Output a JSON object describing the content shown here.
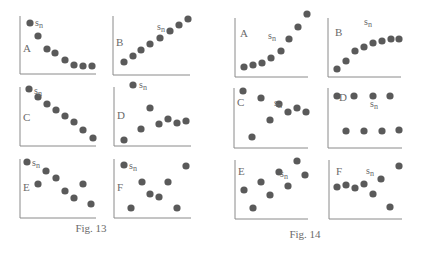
{
  "figures": [
    {
      "caption": "Fig. 13",
      "caption_pos": [
        91,
        232
      ],
      "panels": [
        {
          "label": "A",
          "axis": {
            "x0": 20,
            "y0": 16,
            "x1": 96,
            "y1": 74
          },
          "label_pos": [
            23,
            52
          ],
          "sn_pos": [
            35,
            26
          ],
          "points": [
            [
              30,
              23
            ],
            [
              38,
              36
            ],
            [
              47,
              49
            ],
            [
              55,
              53
            ],
            [
              65,
              60
            ],
            [
              74,
              65
            ],
            [
              83,
              66
            ],
            [
              92,
              66
            ]
          ]
        },
        {
          "label": "B",
          "axis": {
            "x0": 113,
            "y0": 16,
            "x1": 190,
            "y1": 75
          },
          "label_pos": [
            116,
            46
          ],
          "sn_pos": [
            157,
            30
          ],
          "points": [
            [
              124,
              62
            ],
            [
              133,
              56
            ],
            [
              141,
              50
            ],
            [
              150,
              44
            ],
            [
              160,
              38
            ],
            [
              170,
              31
            ],
            [
              179,
              25
            ],
            [
              188,
              19
            ]
          ]
        },
        {
          "label": "C",
          "axis": {
            "x0": 20,
            "y0": 87,
            "x1": 96,
            "y1": 146
          },
          "label_pos": [
            23,
            121
          ],
          "sn_pos": [
            34,
            94
          ],
          "points": [
            [
              29,
              89
            ],
            [
              38,
              97
            ],
            [
              47,
              104
            ],
            [
              56,
              110
            ],
            [
              65,
              116
            ],
            [
              74,
              122
            ],
            [
              83,
              130
            ],
            [
              93,
              138
            ]
          ]
        },
        {
          "label": "D",
          "axis": {
            "x0": 114,
            "y0": 87,
            "x1": 191,
            "y1": 146
          },
          "label_pos": [
            117,
            119
          ],
          "sn_pos": [
            139,
            88
          ],
          "points": [
            [
              133,
              85
            ],
            [
              124,
              140
            ],
            [
              141,
              129
            ],
            [
              150,
              108
            ],
            [
              159,
              124
            ],
            [
              168,
              119
            ],
            [
              177,
              123
            ],
            [
              186,
              121
            ]
          ]
        },
        {
          "label": "E",
          "axis": {
            "x0": 20,
            "y0": 159,
            "x1": 96,
            "y1": 218
          },
          "label_pos": [
            23,
            191
          ],
          "sn_pos": [
            32,
            166
          ],
          "points": [
            [
              27,
              162
            ],
            [
              46,
              171
            ],
            [
              38,
              184
            ],
            [
              56,
              178
            ],
            [
              65,
              191
            ],
            [
              74,
              198
            ],
            [
              83,
              184
            ],
            [
              91,
              204
            ]
          ]
        },
        {
          "label": "F",
          "axis": {
            "x0": 114,
            "y0": 159,
            "x1": 191,
            "y1": 218
          },
          "label_pos": [
            117,
            191
          ],
          "sn_pos": [
            129,
            169
          ],
          "points": [
            [
              124,
              165
            ],
            [
              131,
              208
            ],
            [
              142,
              182
            ],
            [
              150,
              194
            ],
            [
              159,
              197
            ],
            [
              168,
              182
            ],
            [
              177,
              208
            ],
            [
              186,
              166
            ]
          ]
        }
      ]
    },
    {
      "caption": "Fig. 14",
      "caption_pos": [
        305,
        238
      ],
      "panels": [
        {
          "label": "A",
          "axis": {
            "x0": 235,
            "y0": 18,
            "x1": 308,
            "y1": 77
          },
          "label_pos": [
            240,
            37
          ],
          "sn_pos": [
            268,
            39
          ],
          "points": [
            [
              244,
              67
            ],
            [
              253,
              65
            ],
            [
              262,
              63
            ],
            [
              271,
              58
            ],
            [
              281,
              51
            ],
            [
              289,
              39
            ],
            [
              298,
              27
            ],
            [
              307,
              14
            ]
          ]
        },
        {
          "label": "B",
          "axis": {
            "x0": 328,
            "y0": 18,
            "x1": 401,
            "y1": 77
          },
          "label_pos": [
            335,
            36
          ],
          "sn_pos": [
            364,
            25
          ],
          "points": [
            [
              337,
              69
            ],
            [
              346,
              61
            ],
            [
              355,
              51
            ],
            [
              364,
              47
            ],
            [
              373,
              43
            ],
            [
              382,
              41
            ],
            [
              391,
              39
            ],
            [
              399,
              39
            ]
          ]
        },
        {
          "label": "C",
          "axis": {
            "x0": 234,
            "y0": 88,
            "x1": 308,
            "y1": 148
          },
          "label_pos": [
            237,
            106
          ],
          "sn_pos": [
            274,
            106
          ],
          "points": [
            [
              243,
              91
            ],
            [
              252,
              137
            ],
            [
              261,
              98
            ],
            [
              270,
              120
            ],
            [
              279,
              104
            ],
            [
              288,
              112
            ],
            [
              297,
              108
            ],
            [
              306,
              112
            ]
          ]
        },
        {
          "label": "D",
          "axis": {
            "x0": 328,
            "y0": 88,
            "x1": 402,
            "y1": 148
          },
          "label_pos": [
            339,
            101
          ],
          "sn_pos": [
            370,
            107
          ],
          "points": [
            [
              337,
              96
            ],
            [
              354,
              96
            ],
            [
              373,
              96
            ],
            [
              390,
              96
            ],
            [
              346,
              131
            ],
            [
              364,
              131
            ],
            [
              382,
              131
            ],
            [
              399,
              130
            ]
          ]
        },
        {
          "label": "E",
          "axis": {
            "x0": 235,
            "y0": 160,
            "x1": 308,
            "y1": 219
          },
          "label_pos": [
            238,
            175
          ],
          "sn_pos": [
            280,
            177
          ],
          "points": [
            [
              244,
              190
            ],
            [
              253,
              208
            ],
            [
              261,
              182
            ],
            [
              270,
              195
            ],
            [
              279,
              172
            ],
            [
              288,
              186
            ],
            [
              297,
              161
            ],
            [
              305,
              175
            ]
          ]
        },
        {
          "label": "F",
          "axis": {
            "x0": 329,
            "y0": 160,
            "x1": 402,
            "y1": 219
          },
          "label_pos": [
            336,
            175
          ],
          "sn_pos": [
            366,
            174
          ],
          "points": [
            [
              337,
              187
            ],
            [
              346,
              185
            ],
            [
              355,
              188
            ],
            [
              364,
              184
            ],
            [
              373,
              194
            ],
            [
              381,
              179
            ],
            [
              390,
              207
            ],
            [
              399,
              166
            ]
          ]
        }
      ]
    }
  ],
  "sn_label": "s",
  "sn_sub": "n",
  "colors": {
    "dot": "#5a5a5a",
    "axis": "#8a8a8a",
    "text": "#6a6a6a"
  },
  "chart_data": [
    {
      "type": "scatter",
      "title": "Fig. 13",
      "series": [
        {
          "name": "A",
          "values": [
            [
              1,
              8
            ],
            [
              2,
              5
            ],
            [
              3,
              3
            ],
            [
              4,
              2.5
            ],
            [
              5,
              1.5
            ],
            [
              6,
              1
            ],
            [
              7,
              0.9
            ],
            [
              8,
              0.9
            ]
          ]
        },
        {
          "name": "B",
          "values": [
            [
              1,
              1.5
            ],
            [
              2,
              2.4
            ],
            [
              3,
              3.2
            ],
            [
              4,
              4
            ],
            [
              5,
              4.8
            ],
            [
              6,
              5.7
            ],
            [
              7,
              6.5
            ],
            [
              8,
              7.3
            ]
          ]
        },
        {
          "name": "C",
          "values": [
            [
              1,
              7.5
            ],
            [
              2,
              6.5
            ],
            [
              3,
              5.6
            ],
            [
              4,
              4.8
            ],
            [
              5,
              4
            ],
            [
              6,
              3.2
            ],
            [
              7,
              2.2
            ],
            [
              8,
              1.1
            ]
          ]
        },
        {
          "name": "D",
          "values": [
            [
              1,
              0.8
            ],
            [
              2,
              2.3
            ],
            [
              3,
              5.1
            ],
            [
              4,
              3
            ],
            [
              5,
              3.6
            ],
            [
              6,
              3.1
            ],
            [
              7,
              3.4
            ],
            [
              8,
              8.1
            ]
          ]
        },
        {
          "name": "E",
          "values": [
            [
              1,
              7.6
            ],
            [
              2,
              4.6
            ],
            [
              3,
              5.4
            ],
            [
              4,
              6.4
            ],
            [
              5,
              3.7
            ],
            [
              6,
              2.7
            ],
            [
              7,
              4.6
            ],
            [
              8,
              1.8
            ]
          ]
        },
        {
          "name": "F",
          "values": [
            [
              1,
              7.1
            ],
            [
              2,
              1.3
            ],
            [
              3,
              4.7
            ],
            [
              4,
              3.2
            ],
            [
              5,
              2.8
            ],
            [
              6,
              4.7
            ],
            [
              7,
              1.3
            ],
            [
              8,
              7
            ]
          ]
        }
      ],
      "annotations": [
        "s_n"
      ]
    },
    {
      "type": "scatter",
      "title": "Fig. 14",
      "series": [
        {
          "name": "A",
          "values": [
            [
              1,
              1.3
            ],
            [
              2,
              1.6
            ],
            [
              3,
              1.8
            ],
            [
              4,
              2.5
            ],
            [
              5,
              3.4
            ],
            [
              6,
              5
            ],
            [
              7,
              6.6
            ],
            [
              8,
              8.4
            ]
          ]
        },
        {
          "name": "B",
          "values": [
            [
              1,
              1.1
            ],
            [
              2,
              2.2
            ],
            [
              3,
              3.5
            ],
            [
              4,
              4
            ],
            [
              5,
              4.6
            ],
            [
              6,
              4.8
            ],
            [
              7,
              5.1
            ],
            [
              8,
              5.1
            ]
          ]
        },
        {
          "name": "C",
          "values": [
            [
              1,
              7.6
            ],
            [
              2,
              1.5
            ],
            [
              3,
              6.7
            ],
            [
              4,
              3.7
            ],
            [
              5,
              5.9
            ],
            [
              6,
              4.8
            ],
            [
              7,
              5.3
            ],
            [
              8,
              4.8
            ]
          ]
        },
        {
          "name": "D",
          "values": [
            [
              1,
              6.8
            ],
            [
              2,
              2.3
            ],
            [
              3,
              6.8
            ],
            [
              4,
              2.3
            ],
            [
              5,
              6.8
            ],
            [
              6,
              2.3
            ],
            [
              7,
              6.8
            ],
            [
              8,
              2.3
            ]
          ]
        },
        {
          "name": "E",
          "values": [
            [
              1,
              3.9
            ],
            [
              2,
              1.5
            ],
            [
              3,
              5
            ],
            [
              4,
              3.3
            ],
            [
              5,
              6.3
            ],
            [
              6,
              4.4
            ],
            [
              7,
              7.8
            ],
            [
              8,
              5.9
            ]
          ]
        },
        {
          "name": "F",
          "values": [
            [
              1,
              4.3
            ],
            [
              2,
              4.6
            ],
            [
              3,
              4.2
            ],
            [
              4,
              4.7
            ],
            [
              5,
              3.4
            ],
            [
              6,
              5.4
            ],
            [
              7,
              1.6
            ],
            [
              8,
              7.1
            ]
          ]
        }
      ],
      "annotations": [
        "s_n"
      ]
    }
  ]
}
